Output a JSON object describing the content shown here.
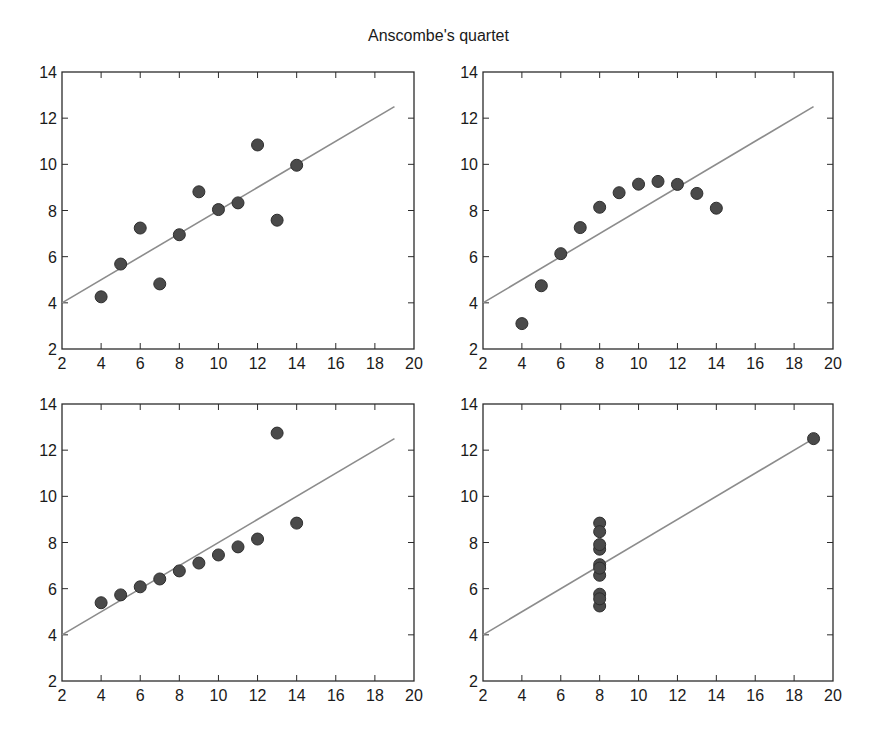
{
  "title": "Anscombe's quartet",
  "style": {
    "marker_color": "#4a4a4a",
    "marker_edge": "#2e2e2e",
    "line_color": "#8c8c8c",
    "axis_color": "#2b2b2b",
    "marker_radius": 6
  },
  "layout": {
    "panels": [
      {
        "left": 62,
        "top": 72,
        "width": 352,
        "height": 277
      },
      {
        "left": 483,
        "top": 72,
        "width": 350,
        "height": 277
      },
      {
        "left": 62,
        "top": 404,
        "width": 352,
        "height": 277
      },
      {
        "left": 483,
        "top": 404,
        "width": 350,
        "height": 277
      }
    ]
  },
  "chart_data": [
    {
      "type": "scatter",
      "title": "",
      "xlabel": "",
      "ylabel": "",
      "xlim": [
        2,
        20
      ],
      "ylim": [
        2,
        14
      ],
      "xticks": [
        2,
        4,
        6,
        8,
        10,
        12,
        14,
        16,
        18,
        20
      ],
      "yticks": [
        2,
        4,
        6,
        8,
        10,
        12,
        14
      ],
      "grid": false,
      "x": [
        10,
        8,
        13,
        9,
        11,
        14,
        6,
        4,
        12,
        7,
        5
      ],
      "y": [
        8.04,
        6.95,
        7.58,
        8.81,
        8.33,
        9.96,
        7.24,
        4.26,
        10.84,
        4.82,
        5.68
      ],
      "fit_line": {
        "x": [
          2,
          19
        ],
        "y": [
          4.0,
          12.5
        ]
      }
    },
    {
      "type": "scatter",
      "title": "",
      "xlabel": "",
      "ylabel": "",
      "xlim": [
        2,
        20
      ],
      "ylim": [
        2,
        14
      ],
      "xticks": [
        2,
        4,
        6,
        8,
        10,
        12,
        14,
        16,
        18,
        20
      ],
      "yticks": [
        2,
        4,
        6,
        8,
        10,
        12,
        14
      ],
      "grid": false,
      "x": [
        10,
        8,
        13,
        9,
        11,
        14,
        6,
        4,
        12,
        7,
        5
      ],
      "y": [
        9.14,
        8.14,
        8.74,
        8.77,
        9.26,
        8.1,
        6.13,
        3.1,
        9.13,
        7.26,
        4.74
      ],
      "fit_line": {
        "x": [
          2,
          19
        ],
        "y": [
          4.0,
          12.5
        ]
      }
    },
    {
      "type": "scatter",
      "title": "",
      "xlabel": "",
      "ylabel": "",
      "xlim": [
        2,
        20
      ],
      "ylim": [
        2,
        14
      ],
      "xticks": [
        2,
        4,
        6,
        8,
        10,
        12,
        14,
        16,
        18,
        20
      ],
      "yticks": [
        2,
        4,
        6,
        8,
        10,
        12,
        14
      ],
      "grid": false,
      "x": [
        10,
        8,
        13,
        9,
        11,
        14,
        6,
        4,
        12,
        7,
        5
      ],
      "y": [
        7.46,
        6.77,
        12.74,
        7.11,
        7.81,
        8.84,
        6.08,
        5.39,
        8.15,
        6.42,
        5.73
      ],
      "fit_line": {
        "x": [
          2,
          19
        ],
        "y": [
          4.0,
          12.5
        ]
      }
    },
    {
      "type": "scatter",
      "title": "",
      "xlabel": "",
      "ylabel": "",
      "xlim": [
        2,
        20
      ],
      "ylim": [
        2,
        14
      ],
      "xticks": [
        2,
        4,
        6,
        8,
        10,
        12,
        14,
        16,
        18,
        20
      ],
      "yticks": [
        2,
        4,
        6,
        8,
        10,
        12,
        14
      ],
      "grid": false,
      "x": [
        8,
        8,
        8,
        8,
        8,
        8,
        8,
        19,
        8,
        8,
        8
      ],
      "y": [
        6.58,
        5.76,
        7.71,
        8.84,
        8.47,
        7.04,
        5.25,
        12.5,
        5.56,
        7.91,
        6.89
      ],
      "fit_line": {
        "x": [
          2,
          19
        ],
        "y": [
          4.0,
          12.5
        ]
      }
    }
  ]
}
